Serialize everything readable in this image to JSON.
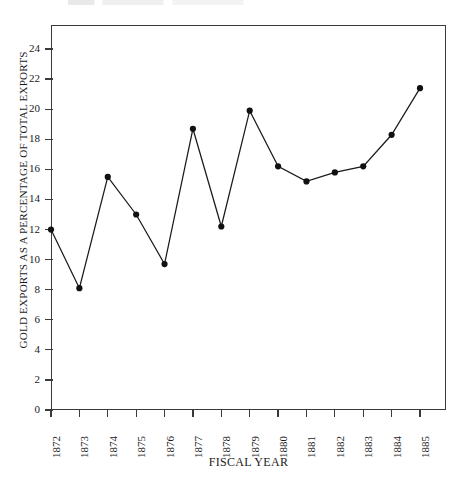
{
  "chart_data": {
    "type": "line",
    "title": "",
    "xlabel": "FISCAL YEAR",
    "ylabel": "GOLD EXPORTS AS A PERCENTAGE OF TOTAL EXPORTS",
    "categories": [
      "1872",
      "1873",
      "1874",
      "1875",
      "1876",
      "1877",
      "1878",
      "1879",
      "1880",
      "1881",
      "1882",
      "1883",
      "1884",
      "1885"
    ],
    "values": [
      12.0,
      8.1,
      15.5,
      13.0,
      9.7,
      18.7,
      12.2,
      19.9,
      16.2,
      15.2,
      15.8,
      16.2,
      18.3,
      21.4
    ],
    "xtick_labels": [
      "1872",
      "1873",
      "1874",
      "1875",
      "1876",
      "1877",
      "1878",
      "1879",
      "1880",
      "1881",
      "1882",
      "1883",
      "1884",
      "1885"
    ],
    "ytick_labels": [
      "0",
      "2",
      "4",
      "6",
      "8",
      "10",
      "12",
      "14",
      "16",
      "18",
      "20",
      "22",
      "24"
    ],
    "ytick_values": [
      0,
      2,
      4,
      6,
      8,
      10,
      12,
      14,
      16,
      18,
      20,
      22,
      24
    ],
    "ylim": [
      0,
      25.6
    ],
    "xlim": [
      1871.5,
      1885.5
    ],
    "grid": false,
    "legend": false,
    "legend_position": "none",
    "marker": "filled-circle",
    "line_color": "#1a1a1a",
    "marker_color": "#111111",
    "axis_color": "#3a3a3a",
    "background_color": "#ffffff"
  },
  "figure": {
    "y_axis_title": "GOLD EXPORTS AS A PERCENTAGE OF TOTAL EXPORTS",
    "x_axis_title": "FISCAL YEAR"
  }
}
